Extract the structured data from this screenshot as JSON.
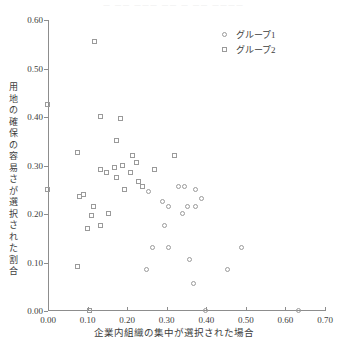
{
  "top_bleed_text": "—  ——  ———  ——  —  ——  ————",
  "legend": {
    "position": "top-right",
    "entries": [
      {
        "marker": "circle",
        "label": "グループ1"
      },
      {
        "marker": "square",
        "label": "グループ2"
      }
    ]
  },
  "chart_data": {
    "type": "scatter",
    "title": "",
    "xlabel": "企業内組織の集中が選択された場合",
    "ylabel": "用地の確保の容易さが選択された割合",
    "xlim": [
      0.0,
      0.7
    ],
    "ylim": [
      0.0,
      0.6
    ],
    "xticks": [
      0.0,
      0.1,
      0.2,
      0.3,
      0.4,
      0.5,
      0.6,
      0.7
    ],
    "yticks": [
      0.0,
      0.1,
      0.2,
      0.3,
      0.4,
      0.5,
      0.6
    ],
    "xtick_labels": [
      "0.00",
      "0.10",
      "0.20",
      "0.30",
      "0.40",
      "0.50",
      "0.60",
      "0.70"
    ],
    "ytick_labels": [
      "0.00",
      "0.10",
      "0.20",
      "0.30",
      "0.40",
      "0.50",
      "0.60"
    ],
    "grid": false,
    "series": [
      {
        "name": "グループ1",
        "marker": "circle",
        "points": [
          [
            0.4,
            0.0
          ],
          [
            0.635,
            0.0
          ],
          [
            0.37,
            0.055
          ],
          [
            0.25,
            0.085
          ],
          [
            0.455,
            0.085
          ],
          [
            0.36,
            0.105
          ],
          [
            0.265,
            0.13
          ],
          [
            0.305,
            0.13
          ],
          [
            0.49,
            0.13
          ],
          [
            0.295,
            0.175
          ],
          [
            0.34,
            0.2
          ],
          [
            0.355,
            0.215
          ],
          [
            0.375,
            0.215
          ],
          [
            0.29,
            0.225
          ],
          [
            0.305,
            0.215
          ],
          [
            0.39,
            0.23
          ],
          [
            0.255,
            0.245
          ],
          [
            0.33,
            0.255
          ],
          [
            0.345,
            0.255
          ],
          [
            0.375,
            0.25
          ]
        ]
      },
      {
        "name": "グループ2",
        "marker": "square",
        "points": [
          [
            0.105,
            0.0
          ],
          [
            0.12,
            0.555
          ],
          [
            0.0,
            0.425
          ],
          [
            0.135,
            0.4
          ],
          [
            0.185,
            0.395
          ],
          [
            0.175,
            0.35
          ],
          [
            0.075,
            0.325
          ],
          [
            0.215,
            0.32
          ],
          [
            0.135,
            0.29
          ],
          [
            0.15,
            0.285
          ],
          [
            0.17,
            0.295
          ],
          [
            0.175,
            0.275
          ],
          [
            0.19,
            0.3
          ],
          [
            0.21,
            0.285
          ],
          [
            0.225,
            0.305
          ],
          [
            0.24,
            0.255
          ],
          [
            0.27,
            0.29
          ],
          [
            0.195,
            0.25
          ],
          [
            0.23,
            0.265
          ],
          [
            0.0,
            0.25
          ],
          [
            0.08,
            0.235
          ],
          [
            0.09,
            0.24
          ],
          [
            0.115,
            0.215
          ],
          [
            0.11,
            0.195
          ],
          [
            0.1,
            0.17
          ],
          [
            0.135,
            0.175
          ],
          [
            0.155,
            0.2
          ],
          [
            0.075,
            0.09
          ],
          [
            0.32,
            0.32
          ]
        ]
      }
    ]
  }
}
